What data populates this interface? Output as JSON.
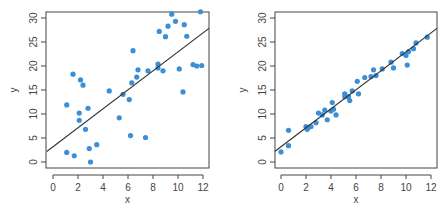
{
  "chart_data": [
    {
      "type": "scatter",
      "title": "",
      "xlabel": "x",
      "ylabel": "y",
      "xlim": [
        -0.5,
        12.5
      ],
      "ylim": [
        -1.2,
        31.2
      ],
      "xticks": [
        0,
        2,
        4,
        6,
        8,
        10,
        12
      ],
      "yticks": [
        0,
        5,
        10,
        15,
        20,
        25,
        30
      ],
      "grid": false,
      "point_color": "#3b8fd6",
      "line_color": "#333333",
      "fit_line": {
        "x": [
          -0.5,
          12.5
        ],
        "y": [
          2.2,
          27.9
        ]
      },
      "points": [
        {
          "x": 1.1,
          "y": 2.0
        },
        {
          "x": 1.7,
          "y": 1.3
        },
        {
          "x": 1.1,
          "y": 11.9
        },
        {
          "x": 1.6,
          "y": 18.3
        },
        {
          "x": 2.2,
          "y": 17.1
        },
        {
          "x": 2.4,
          "y": 16.0
        },
        {
          "x": 2.1,
          "y": 10.2
        },
        {
          "x": 2.1,
          "y": 8.7
        },
        {
          "x": 2.8,
          "y": 11.2
        },
        {
          "x": 2.6,
          "y": 6.8
        },
        {
          "x": 2.9,
          "y": 2.8
        },
        {
          "x": 3.0,
          "y": 0.0
        },
        {
          "x": 3.5,
          "y": 3.6
        },
        {
          "x": 4.5,
          "y": 14.8
        },
        {
          "x": 5.6,
          "y": 14.1
        },
        {
          "x": 5.3,
          "y": 9.2
        },
        {
          "x": 6.2,
          "y": 5.5
        },
        {
          "x": 6.1,
          "y": 13.0
        },
        {
          "x": 6.4,
          "y": 23.2
        },
        {
          "x": 6.3,
          "y": 16.5
        },
        {
          "x": 6.7,
          "y": 17.7
        },
        {
          "x": 6.8,
          "y": 19.2
        },
        {
          "x": 7.4,
          "y": 5.1
        },
        {
          "x": 7.6,
          "y": 19.0
        },
        {
          "x": 8.4,
          "y": 19.6
        },
        {
          "x": 8.4,
          "y": 20.4
        },
        {
          "x": 8.8,
          "y": 19.0
        },
        {
          "x": 8.5,
          "y": 27.2
        },
        {
          "x": 9.0,
          "y": 26.1
        },
        {
          "x": 9.2,
          "y": 28.3
        },
        {
          "x": 9.5,
          "y": 30.8
        },
        {
          "x": 9.8,
          "y": 29.3
        },
        {
          "x": 10.1,
          "y": 19.4
        },
        {
          "x": 10.4,
          "y": 14.6
        },
        {
          "x": 10.5,
          "y": 28.6
        },
        {
          "x": 10.7,
          "y": 26.2
        },
        {
          "x": 11.2,
          "y": 20.3
        },
        {
          "x": 11.5,
          "y": 20.0
        },
        {
          "x": 11.9,
          "y": 20.1
        },
        {
          "x": 11.8,
          "y": 31.3
        }
      ]
    },
    {
      "type": "scatter",
      "title": "",
      "xlabel": "x",
      "ylabel": "y",
      "xlim": [
        -0.5,
        12.5
      ],
      "ylim": [
        -1.2,
        31.2
      ],
      "xticks": [
        0,
        2,
        4,
        6,
        8,
        10,
        12
      ],
      "yticks": [
        0,
        5,
        10,
        15,
        20,
        25,
        30
      ],
      "grid": false,
      "point_color": "#3b8fd6",
      "line_color": "#333333",
      "fit_line": {
        "x": [
          -0.5,
          12.5
        ],
        "y": [
          2.2,
          27.9
        ]
      },
      "points": [
        {
          "x": 0.0,
          "y": 2.1
        },
        {
          "x": 0.6,
          "y": 3.4
        },
        {
          "x": 0.6,
          "y": 6.6
        },
        {
          "x": 2.0,
          "y": 7.4
        },
        {
          "x": 2.1,
          "y": 6.8
        },
        {
          "x": 2.2,
          "y": 7.2
        },
        {
          "x": 2.4,
          "y": 7.4
        },
        {
          "x": 2.8,
          "y": 8.2
        },
        {
          "x": 3.0,
          "y": 10.2
        },
        {
          "x": 3.3,
          "y": 9.8
        },
        {
          "x": 3.5,
          "y": 10.8
        },
        {
          "x": 3.7,
          "y": 8.8
        },
        {
          "x": 4.0,
          "y": 10.6
        },
        {
          "x": 4.2,
          "y": 11.0
        },
        {
          "x": 4.1,
          "y": 12.4
        },
        {
          "x": 4.4,
          "y": 9.8
        },
        {
          "x": 5.1,
          "y": 13.6
        },
        {
          "x": 5.1,
          "y": 14.2
        },
        {
          "x": 5.4,
          "y": 13.6
        },
        {
          "x": 5.5,
          "y": 12.8
        },
        {
          "x": 5.7,
          "y": 14.8
        },
        {
          "x": 6.1,
          "y": 16.8
        },
        {
          "x": 6.2,
          "y": 14.2
        },
        {
          "x": 6.7,
          "y": 17.6
        },
        {
          "x": 7.2,
          "y": 17.8
        },
        {
          "x": 7.4,
          "y": 19.2
        },
        {
          "x": 7.6,
          "y": 18.0
        },
        {
          "x": 8.1,
          "y": 19.4
        },
        {
          "x": 8.8,
          "y": 20.8
        },
        {
          "x": 9.0,
          "y": 19.6
        },
        {
          "x": 9.7,
          "y": 22.6
        },
        {
          "x": 10.0,
          "y": 22.2
        },
        {
          "x": 10.1,
          "y": 20.2
        },
        {
          "x": 10.2,
          "y": 23.0
        },
        {
          "x": 10.6,
          "y": 23.6
        },
        {
          "x": 10.8,
          "y": 24.8
        },
        {
          "x": 11.7,
          "y": 26.0
        }
      ]
    }
  ]
}
